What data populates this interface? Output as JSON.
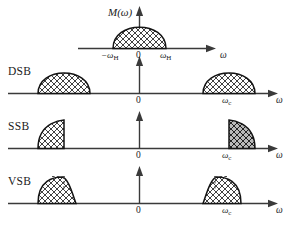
{
  "figure": {
    "title_symbol": "M",
    "title_arg": "(ω)",
    "axis_symbol": "ω",
    "zero_label": "0",
    "colors": {
      "line": "#3a3a3a",
      "fill_light": "#ffffff",
      "fill_dark": "#b9b9b9",
      "hatch": "#2b2b2b",
      "background": "#ffffff"
    }
  },
  "panels": [
    {
      "id": "baseband",
      "row_label": "",
      "ylabel": "M(ω)",
      "axis_label": "ω",
      "zero_label": "0",
      "ticks": [
        {
          "label_main": "−ω",
          "label_sub": "H",
          "x": 113
        },
        {
          "label_main": "ω",
          "label_sub": "H",
          "x": 165
        }
      ],
      "shapes": [
        {
          "kind": "dome",
          "center": 139,
          "half_width": 26,
          "height": 34,
          "shading": "light"
        }
      ]
    },
    {
      "id": "dsb",
      "row_label": "DSB",
      "axis_label": "ω",
      "zero_label": "0",
      "ticks": [
        {
          "label_main": "ω",
          "label_sub": "c",
          "x": 229
        }
      ],
      "shapes": [
        {
          "kind": "dome",
          "center": 64,
          "half_width": 26,
          "height": 26,
          "shading": "light"
        },
        {
          "kind": "dome",
          "center": 229,
          "half_width": 26,
          "height": 26,
          "shading": "light"
        }
      ]
    },
    {
      "id": "ssb",
      "row_label": "SSB",
      "axis_label": "ω",
      "zero_label": "0",
      "ticks": [
        {
          "label_main": "ω",
          "label_sub": "c",
          "x": 229
        }
      ],
      "shapes": [
        {
          "kind": "quarter-left",
          "edge": 64,
          "half_width": 26,
          "height": 28,
          "shading": "light"
        },
        {
          "kind": "quarter-right",
          "edge": 229,
          "half_width": 26,
          "height": 28,
          "shading": "dark"
        }
      ]
    },
    {
      "id": "vsb",
      "row_label": "VSB",
      "axis_label": "ω",
      "zero_label": "0",
      "ticks": [
        {
          "label_main": "ω",
          "label_sub": "c",
          "x": 229
        }
      ],
      "shapes": [
        {
          "kind": "vestigial-left",
          "edge": 64,
          "half_width": 22,
          "height": 26,
          "shading": "light"
        },
        {
          "kind": "vestigial-right",
          "edge": 229,
          "half_width": 22,
          "height": 26,
          "shading": "light"
        }
      ]
    }
  ]
}
